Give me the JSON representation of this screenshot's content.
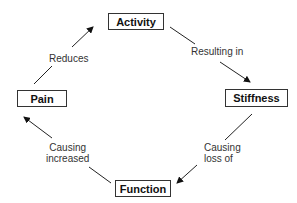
{
  "diagram": {
    "type": "cycle",
    "nodes": [
      {
        "id": "activity",
        "label": "Activity"
      },
      {
        "id": "stiffness",
        "label": "Stiffness"
      },
      {
        "id": "function",
        "label": "Function"
      },
      {
        "id": "pain",
        "label": "Pain"
      }
    ],
    "edges": [
      {
        "from": "activity",
        "to": "stiffness",
        "label": "Resulting in"
      },
      {
        "from": "stiffness",
        "to": "function",
        "label": "Causing\nloss of"
      },
      {
        "from": "function",
        "to": "pain",
        "label": "Causing\nincreased"
      },
      {
        "from": "pain",
        "to": "activity",
        "label": "Reduces"
      }
    ]
  }
}
